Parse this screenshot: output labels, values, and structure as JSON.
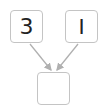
{
  "diagram": {
    "inputs": [
      {
        "value": "3"
      },
      {
        "value": "I"
      }
    ],
    "output": {
      "value": ""
    },
    "colors": {
      "border": "#c4c4c4",
      "arrow": "#b0b0b0",
      "text": "#222222"
    }
  }
}
